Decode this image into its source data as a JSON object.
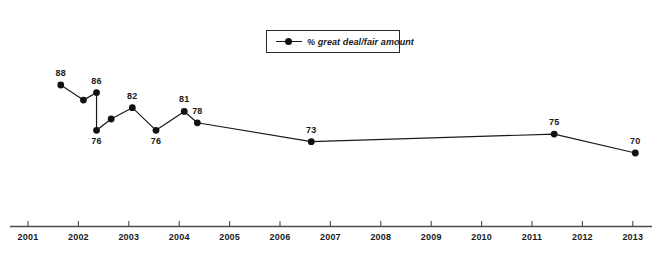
{
  "chart_data": {
    "type": "line",
    "title": "",
    "subtitle": "",
    "xlabel": "",
    "ylabel": "",
    "grid": false,
    "legend_position": "top-center",
    "legend": [
      "% great deal/fair amount"
    ],
    "xlim": [
      2000.7,
      2013.6
    ],
    "ylim": [
      62,
      92
    ],
    "x_ticks": [
      "2001",
      "2002",
      "2003",
      "2004",
      "2005",
      "2006",
      "2007",
      "2008",
      "2009",
      "2010",
      "2011",
      "2012",
      "2013"
    ],
    "series": [
      {
        "name": "% great deal/fair amount",
        "color": "#111111",
        "points": [
          {
            "x": 2001.65,
            "y": 88,
            "label": "88",
            "label_pos": "above"
          },
          {
            "x": 2002.1,
            "y": 84,
            "label": "",
            "label_pos": "above"
          },
          {
            "x": 2002.36,
            "y": 86,
            "label": "86",
            "label_pos": "above"
          },
          {
            "x": 2002.36,
            "y": 76,
            "label": "76",
            "label_pos": "below"
          },
          {
            "x": 2002.65,
            "y": 79,
            "label": "",
            "label_pos": "above"
          },
          {
            "x": 2003.07,
            "y": 82,
            "label": "82",
            "label_pos": "above"
          },
          {
            "x": 2003.54,
            "y": 76,
            "label": "76",
            "label_pos": "below"
          },
          {
            "x": 2004.1,
            "y": 81,
            "label": "81",
            "label_pos": "above"
          },
          {
            "x": 2004.36,
            "y": 78,
            "label": "78",
            "label_pos": "above"
          },
          {
            "x": 2006.62,
            "y": 73,
            "label": "73",
            "label_pos": "above"
          },
          {
            "x": 2011.44,
            "y": 75,
            "label": "75",
            "label_pos": "above"
          },
          {
            "x": 2013.05,
            "y": 70,
            "label": "70",
            "label_pos": "above"
          }
        ]
      }
    ]
  },
  "axis": {
    "line_color": "#4a4a4a"
  }
}
